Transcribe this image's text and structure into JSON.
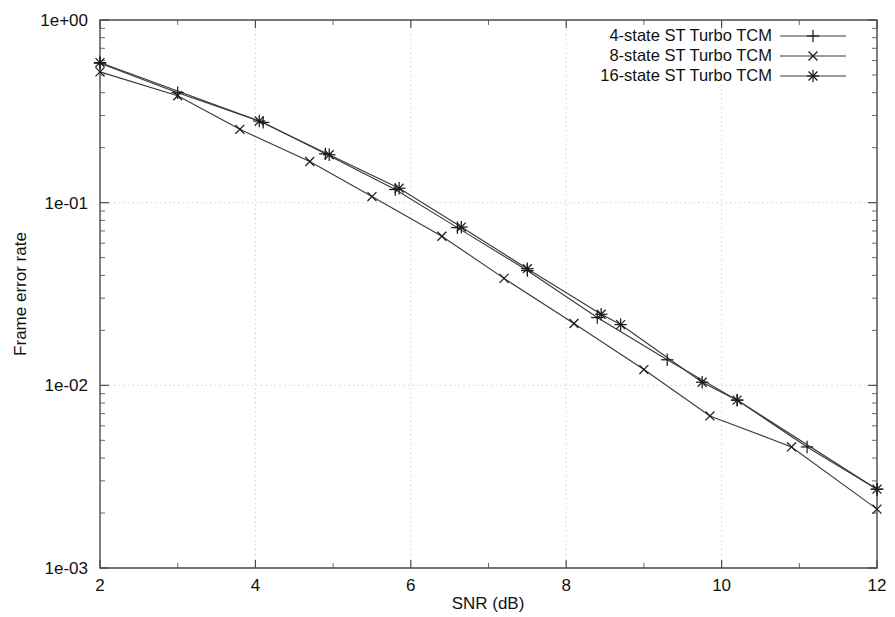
{
  "chart_data": {
    "type": "line",
    "title": "",
    "xlabel": "SNR (dB)",
    "ylabel": "Frame error rate",
    "xlim": [
      2,
      12
    ],
    "ylim": [
      0.001,
      1
    ],
    "yscale": "log",
    "xscale": "linear",
    "grid": true,
    "legend_position": "top-right",
    "xticks": [
      "2",
      "4",
      "6",
      "8",
      "10",
      "12"
    ],
    "xtick_values": [
      2,
      4,
      6,
      8,
      10,
      12
    ],
    "yticks": [
      "1e+00",
      "1e-01",
      "1e-02",
      "1e-03"
    ],
    "ytick_values": [
      1,
      0.1,
      0.01,
      0.001
    ],
    "series": [
      {
        "name": "4-state ST Turbo TCM",
        "marker": "plus",
        "x": [
          2.0,
          3.0,
          4.1,
          4.9,
          5.8,
          6.6,
          7.5,
          8.4,
          9.3,
          10.2,
          11.1,
          12.0
        ],
        "y": [
          0.58,
          0.4,
          0.275,
          0.185,
          0.118,
          0.073,
          0.0425,
          0.0235,
          0.0138,
          0.0083,
          0.0046,
          0.0027
        ]
      },
      {
        "name": "8-state ST Turbo TCM",
        "marker": "cross",
        "x": [
          2.0,
          3.0,
          3.8,
          4.7,
          5.5,
          6.4,
          7.2,
          8.1,
          9.0,
          9.85,
          10.9,
          12.0
        ],
        "y": [
          0.52,
          0.385,
          0.252,
          0.168,
          0.108,
          0.0655,
          0.0385,
          0.0218,
          0.0122,
          0.0068,
          0.0046,
          0.0021
        ]
      },
      {
        "name": "16-state ST Turbo TCM",
        "marker": "star",
        "x": [
          2.0,
          4.05,
          4.95,
          5.85,
          6.65,
          7.5,
          8.45,
          8.7,
          9.75,
          10.2,
          12.0
        ],
        "y": [
          0.585,
          0.28,
          0.183,
          0.12,
          0.0735,
          0.0435,
          0.0245,
          0.0215,
          0.0104,
          0.0083,
          0.0027
        ]
      }
    ]
  },
  "legend": {
    "items": [
      {
        "label": "4-state ST Turbo TCM",
        "marker": "plus"
      },
      {
        "label": "8-state ST Turbo TCM",
        "marker": "cross"
      },
      {
        "label": "16-state ST Turbo TCM",
        "marker": "star"
      }
    ]
  },
  "colors": {
    "curve": "#3a3a3a",
    "axis": "#4a4a4a",
    "grid": "#c9c9c9",
    "text": "#111111",
    "background": "#ffffff"
  }
}
